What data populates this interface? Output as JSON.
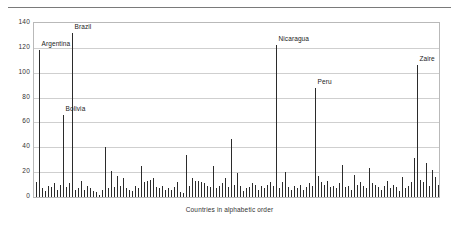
{
  "chart_data": {
    "type": "bar",
    "title": "",
    "xlabel": "Countries in alphabetic order",
    "ylabel": "",
    "ylim": [
      0,
      140
    ],
    "ytick_step": 20,
    "yticks": [
      0,
      20,
      40,
      60,
      80,
      100,
      120,
      140
    ],
    "grid": true,
    "legend": "none",
    "xtick_labels": [],
    "bar_color": "#2b2b2b",
    "grid_color": "#cfcfcf",
    "frame_color": "#b9b9b9",
    "categories_note": "Countries in alphabetic order (unlabeled individual bars)",
    "annotations": [
      {
        "label": "Argentina",
        "index": 1,
        "value": 118
      },
      {
        "label": "Brazil",
        "index": 12,
        "value": 132
      },
      {
        "label": "Bolivia",
        "index": 9,
        "value": 66
      },
      {
        "label": "Nicaragua",
        "index": 80,
        "value": 122
      },
      {
        "label": "Peru",
        "index": 93,
        "value": 88
      },
      {
        "label": "Zaire",
        "index": 127,
        "value": 106
      }
    ],
    "values": [
      12,
      118,
      7,
      5,
      9,
      8,
      11,
      6,
      10,
      66,
      8,
      11,
      132,
      6,
      7,
      13,
      6,
      9,
      7,
      5,
      4,
      2,
      6,
      40,
      7,
      21,
      8,
      17,
      9,
      15,
      7,
      6,
      5,
      9,
      7,
      25,
      12,
      13,
      14,
      15,
      8,
      7,
      9,
      6,
      7,
      6,
      8,
      12,
      4,
      3,
      34,
      9,
      15,
      13,
      13,
      12,
      11,
      9,
      8,
      25,
      7,
      9,
      11,
      15,
      8,
      47,
      10,
      19,
      9,
      5,
      7,
      8,
      11,
      10,
      6,
      9,
      7,
      10,
      12,
      9,
      122,
      7,
      12,
      20,
      8,
      6,
      9,
      7,
      10,
      6,
      8,
      11,
      9,
      88,
      17,
      12,
      10,
      13,
      8,
      9,
      7,
      11,
      26,
      8,
      9,
      6,
      18,
      10,
      12,
      9,
      7,
      23,
      11,
      10,
      8,
      6,
      9,
      13,
      7,
      10,
      8,
      5,
      16,
      7,
      9,
      12,
      31,
      106,
      14,
      12,
      27,
      9,
      22,
      16,
      10
    ]
  }
}
